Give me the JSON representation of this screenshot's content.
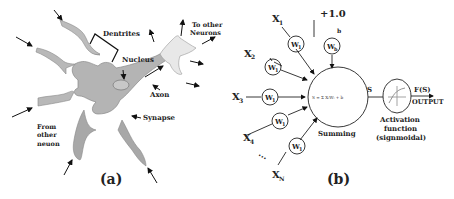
{
  "panel_a": {
    "caption": "(a)",
    "labels": {
      "dentrites": "Dentrites",
      "nucleus": "Nucleus",
      "axon": "Axon",
      "synapse": "Synapse",
      "to_other_1": "To other",
      "to_other_2": "Neurons",
      "from_other_1": "From",
      "from_other_2": "other",
      "from_other_3": "neuon"
    }
  },
  "panel_b": {
    "caption": "(b)",
    "bias_input": "+1.0",
    "bias_label": "b",
    "bias_weight": "W",
    "bias_weight_sub": "b",
    "inputs": [
      {
        "name": "X",
        "sub": "1",
        "weight": "W",
        "weight_sub": "1"
      },
      {
        "name": "X",
        "sub": "2",
        "weight": "W",
        "weight_sub": "1"
      },
      {
        "name": "X",
        "sub": "3",
        "weight": "W",
        "weight_sub": "1"
      },
      {
        "name": "X",
        "sub": "4",
        "weight": "W",
        "weight_sub": "1"
      },
      {
        "name": "X",
        "sub": "N",
        "weight": "W",
        "weight_sub": "1"
      }
    ],
    "ellipsis": "⋯",
    "sum_formula": "S = Σ XᵢWᵢ + b",
    "sum_label": "Summing",
    "s_label": "S",
    "activation_1": "Activation",
    "activation_2": "function",
    "activation_3": "(signmoidal)",
    "output_fs": "F(S)",
    "output_label": "OUTPUT"
  }
}
